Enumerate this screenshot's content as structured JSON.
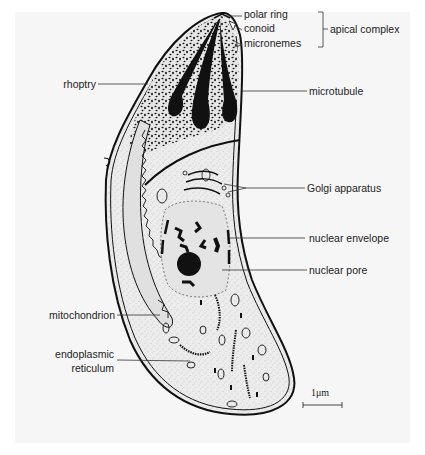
{
  "figure": {
    "background": "#f6f6f6"
  },
  "labels": {
    "polar_ring": "polar ring",
    "conoid": "conoid",
    "micronemes": "micronemes",
    "apical_complex": "apical complex",
    "rhoptry": "rhoptry",
    "microtubule": "microtubule",
    "golgi": "Golgi apparatus",
    "nuclear_envelope": "nuclear envelope",
    "nuclear_pore": "nuclear pore",
    "mitochondrion": "mitochondrion",
    "er_line1": "endoplasmic",
    "er_line2": "reticulum"
  },
  "scale_bar": {
    "label": "1μm"
  },
  "colors": {
    "ink": "#111111",
    "cytoplasm": "#ececec",
    "text": "#222222"
  }
}
